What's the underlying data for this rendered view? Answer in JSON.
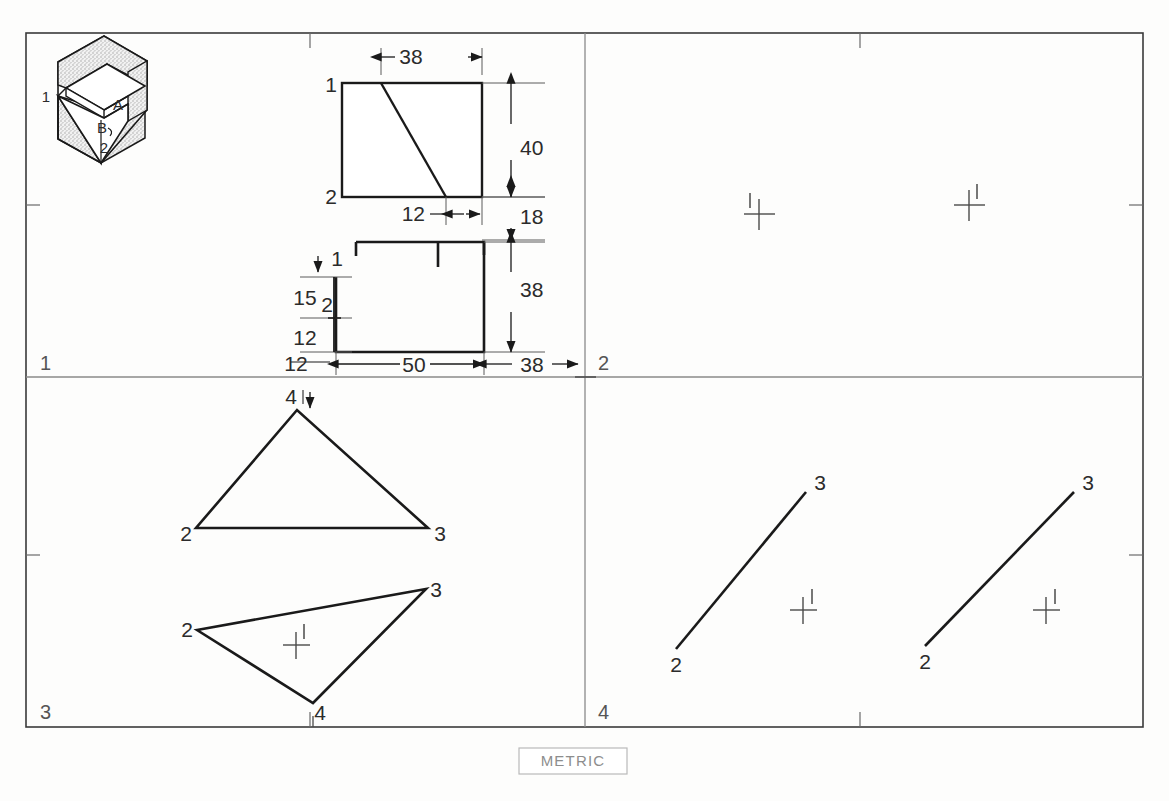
{
  "sheet": {
    "title": "Orthographic projection worksheet",
    "metric_note": "METRIC",
    "border_color": "#3a3a3a",
    "line_color": "#1a1a1a",
    "divider_color": "#8a8a8a",
    "quadrants": [
      {
        "id": "q1",
        "label": "1"
      },
      {
        "id": "q2",
        "label": "2"
      },
      {
        "id": "q3",
        "label": "3"
      },
      {
        "id": "q4",
        "label": "4"
      }
    ]
  },
  "pictorial": {
    "name": "isometric-block",
    "face_labels": [
      {
        "text": "A",
        "x": 118,
        "y": 110
      },
      {
        "text": "B",
        "x": 102,
        "y": 133
      }
    ],
    "vertex_labels": [
      {
        "text": "1",
        "x": 46,
        "y": 102
      },
      {
        "text": "2",
        "x": 104,
        "y": 153
      }
    ]
  },
  "top_view": {
    "name": "top-view-rectangle",
    "vertex_labels": [
      {
        "text": "1",
        "x": 331,
        "y": 90
      },
      {
        "text": "2",
        "x": 331,
        "y": 202
      }
    ],
    "dimensions": [
      {
        "text": "38",
        "x": 411,
        "y": 62
      },
      {
        "text": "40",
        "x": 513,
        "y": 148
      },
      {
        "text": "12",
        "x": 410,
        "y": 220
      },
      {
        "text": "18",
        "x": 513,
        "y": 220
      }
    ]
  },
  "front_view": {
    "name": "front-view-profile",
    "vertex_labels": [
      {
        "text": "1",
        "x": 336,
        "y": 268
      },
      {
        "text": "2",
        "x": 329,
        "y": 307
      }
    ],
    "dimensions": [
      {
        "text": "15",
        "x": 305,
        "y": 298
      },
      {
        "text": "12",
        "x": 305,
        "y": 341
      },
      {
        "text": "12",
        "x": 296,
        "y": 368
      },
      {
        "text": "50",
        "x": 412,
        "y": 368
      },
      {
        "text": "38",
        "x": 532,
        "y": 368
      },
      {
        "text": "38",
        "x": 513,
        "y": 290
      }
    ]
  },
  "quadrant2": {
    "name": "crosshair-pair",
    "marks": [
      {
        "id": "mark-left",
        "cx": 759,
        "cy": 214,
        "label": "1",
        "label_side": "left"
      },
      {
        "id": "mark-right",
        "cx": 969,
        "cy": 205,
        "label": "1",
        "label_side": "right"
      }
    ]
  },
  "quadrant3": {
    "name": "triangle-pair",
    "upper_triangle": {
      "id": "upper-triangle",
      "vertices": [
        {
          "text": "2",
          "x": 186,
          "y": 535
        },
        {
          "text": "3",
          "x": 425,
          "y": 535
        },
        {
          "text": "4",
          "x": 293,
          "y": 402
        }
      ]
    },
    "lower_triangle": {
      "id": "lower-triangle",
      "vertices": [
        {
          "text": "2",
          "x": 187,
          "y": 636
        },
        {
          "text": "3",
          "x": 422,
          "y": 594
        },
        {
          "text": "4",
          "x": 310,
          "y": 710
        }
      ],
      "mark": {
        "cx": 296,
        "cy": 645,
        "label": "1"
      }
    }
  },
  "quadrant4": {
    "name": "line-pair",
    "segments": [
      {
        "id": "segment-left",
        "from_label": "2",
        "to_label": "3",
        "from_x": 676,
        "from_y": 649,
        "to_x": 806,
        "to_y": 492,
        "mark": {
          "cx": 803,
          "cy": 610,
          "label": "1"
        }
      },
      {
        "id": "segment-right",
        "from_label": "2",
        "to_label": "3",
        "from_x": 925,
        "from_y": 646,
        "to_x": 1074,
        "to_y": 492,
        "mark": {
          "cx": 1046,
          "cy": 610,
          "label": "1"
        }
      }
    ]
  }
}
